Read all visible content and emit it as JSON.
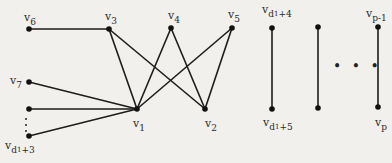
{
  "figure": {
    "type": "graph"
  },
  "nodes": [
    {
      "id": "v6",
      "label": "v",
      "sub": "6",
      "x": 29,
      "y": 29
    },
    {
      "id": "v3",
      "label": "v",
      "sub": "3",
      "x": 109,
      "y": 29
    },
    {
      "id": "v4",
      "label": "v",
      "sub": "4",
      "x": 171,
      "y": 28
    },
    {
      "id": "v5",
      "label": "v",
      "sub": "5",
      "x": 232,
      "y": 28
    },
    {
      "id": "v7",
      "label": "v",
      "sub": "7",
      "x": 29,
      "y": 82
    },
    {
      "id": "vx",
      "label": "",
      "sub": "",
      "x": 29,
      "y": 109
    },
    {
      "id": "vd13",
      "label": "v",
      "sub": "d",
      "subsub": "1",
      "suffix": "+3",
      "x": 29,
      "y": 136
    },
    {
      "id": "v1",
      "label": "v",
      "sub": "1",
      "x": 137,
      "y": 109
    },
    {
      "id": "v2",
      "label": "v",
      "sub": "2",
      "x": 205,
      "y": 109
    },
    {
      "id": "vd14",
      "label": "v",
      "sub": "d",
      "subsub": "1",
      "suffix": "+4",
      "x": 272,
      "y": 28
    },
    {
      "id": "vd15",
      "label": "v",
      "sub": "d",
      "subsub": "1",
      "suffix": "+5",
      "x": 272,
      "y": 109
    },
    {
      "id": "vm1",
      "label": "",
      "sub": "",
      "x": 318,
      "y": 27
    },
    {
      "id": "vm2",
      "label": "",
      "sub": "",
      "x": 318,
      "y": 108
    },
    {
      "id": "vp1",
      "label": "v",
      "sub": "p-1",
      "x": 378,
      "y": 27
    },
    {
      "id": "vp",
      "label": "v",
      "sub": "p",
      "x": 378,
      "y": 107
    }
  ],
  "edges": [
    [
      "v6",
      "v3"
    ],
    [
      "v3",
      "v1"
    ],
    [
      "v3",
      "v2"
    ],
    [
      "v4",
      "v1"
    ],
    [
      "v4",
      "v2"
    ],
    [
      "v5",
      "v1"
    ],
    [
      "v5",
      "v2"
    ],
    [
      "v7",
      "v1"
    ],
    [
      "vx",
      "v1"
    ],
    [
      "vd13",
      "v1"
    ],
    [
      "vd14",
      "vd15"
    ],
    [
      "vm1",
      "vm2"
    ],
    [
      "vp1",
      "vp"
    ]
  ],
  "labels": {
    "v6": {
      "main": "v",
      "sub": "6"
    },
    "v3": {
      "main": "v",
      "sub": "3"
    },
    "v4": {
      "main": "v",
      "sub": "4"
    },
    "v5": {
      "main": "v",
      "sub": "5"
    },
    "v7": {
      "main": "v",
      "sub": "7"
    },
    "vd13": {
      "main": "v",
      "sub": "d",
      "subsub": "1",
      "suffix": "+3"
    },
    "v1": {
      "main": "v",
      "sub": "1"
    },
    "v2": {
      "main": "v",
      "sub": "2"
    },
    "vd14": {
      "main": "v",
      "sub": "d",
      "subsub": "1",
      "suffix": "+4"
    },
    "vd15": {
      "main": "v",
      "sub": "d",
      "subsub": "1",
      "suffix": "+5"
    },
    "vp1": {
      "main": "v",
      "sub": "p-1"
    },
    "vp": {
      "main": "v",
      "sub": "p"
    }
  },
  "ellipsis": {
    "horizontal": "• • •"
  }
}
